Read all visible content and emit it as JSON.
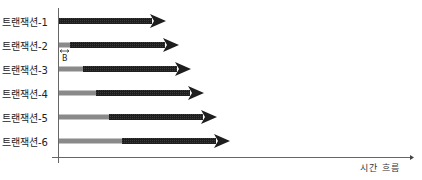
{
  "diagram": {
    "x_axis_label": "시간 흐름",
    "offset_label": "B",
    "transactions": [
      {
        "label": "트랜잭션-1",
        "gray_end": 59,
        "tip": 166,
        "y": 21
      },
      {
        "label": "트랜잭션-2",
        "gray_end": 70,
        "tip": 179,
        "y": 45
      },
      {
        "label": "트랜잭션-3",
        "gray_end": 83,
        "tip": 191,
        "y": 69
      },
      {
        "label": "트랜잭션-4",
        "gray_end": 96,
        "tip": 204,
        "y": 93
      },
      {
        "label": "트랜잭션-5",
        "gray_end": 109,
        "tip": 217,
        "y": 117
      },
      {
        "label": "트랜잭션-6",
        "gray_end": 122,
        "tip": 230,
        "y": 141
      }
    ],
    "colors": {
      "wait": "#8a8a8a",
      "exec": "#1e1e1e",
      "axis": "#666666"
    }
  }
}
